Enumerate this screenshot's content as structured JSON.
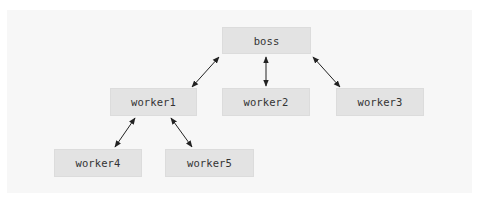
{
  "diagram": {
    "type": "hierarchy",
    "colors": {
      "background": "#ffffff",
      "panel": "#f7f7f7",
      "node_fill": "#e3e3e3",
      "text": "#333333",
      "edge": "#222222"
    },
    "nodes": {
      "boss": {
        "label": "boss"
      },
      "worker1": {
        "label": "worker1"
      },
      "worker2": {
        "label": "worker2"
      },
      "worker3": {
        "label": "worker3"
      },
      "worker4": {
        "label": "worker4"
      },
      "worker5": {
        "label": "worker5"
      }
    },
    "edges": [
      {
        "from": "boss",
        "to": "worker1",
        "direction": "bidirectional"
      },
      {
        "from": "boss",
        "to": "worker2",
        "direction": "bidirectional"
      },
      {
        "from": "boss",
        "to": "worker3",
        "direction": "bidirectional"
      },
      {
        "from": "worker1",
        "to": "worker4",
        "direction": "bidirectional"
      },
      {
        "from": "worker1",
        "to": "worker5",
        "direction": "bidirectional"
      }
    ]
  }
}
